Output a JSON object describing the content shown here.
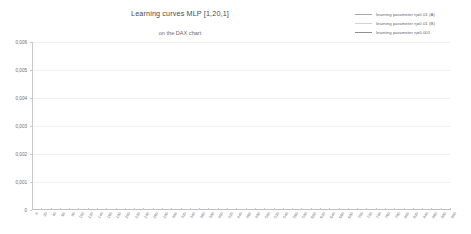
{
  "chart_data": {
    "type": "line",
    "title": "Learning curves MLP [1,20,1]",
    "subtitle": "on the DAX chart",
    "xlabel": "",
    "ylabel": "",
    "xlim": [
      0,
      900
    ],
    "ylim": [
      0,
      0.006
    ],
    "grid": true,
    "legend_position": "top-right",
    "y_ticks": [
      "0,006",
      "0,005",
      "0,004",
      "0,003",
      "0,002",
      "0,001",
      "0"
    ],
    "y_tick_values": [
      0.006,
      0.005,
      0.004,
      0.003,
      0.002,
      0.001,
      0
    ],
    "x_ticks": [
      "0",
      "20",
      "40",
      "60",
      "80",
      "100",
      "120",
      "140",
      "160",
      "180",
      "200",
      "220",
      "240",
      "260",
      "280",
      "300",
      "320",
      "340",
      "360",
      "380",
      "400",
      "420",
      "440",
      "460",
      "480",
      "500",
      "520",
      "540",
      "560",
      "580",
      "600",
      "620",
      "640",
      "660",
      "680",
      "700",
      "720",
      "740",
      "760",
      "780",
      "800",
      "820",
      "840",
      "860",
      "880",
      "900"
    ],
    "series": [
      {
        "name": "learning parameter η=0.01  (A)",
        "color": "#a8a8a8",
        "x": [
          0,
          3,
          6,
          10,
          16,
          24,
          36,
          52,
          75,
          110,
          160,
          230,
          320,
          430,
          560,
          700,
          820,
          900
        ],
        "values": [
          0.006,
          0.0046,
          0.00415,
          0.00398,
          0.0039,
          0.00386,
          0.00384,
          0.00383,
          0.00382,
          0.00381,
          0.0038,
          0.0038,
          0.00379,
          0.00379,
          0.00378,
          0.00378,
          0.00378,
          0.00378
        ]
      },
      {
        "name": "learning parameter η=0.01  (B)",
        "color": "#d2d2d2",
        "x": [
          0,
          3,
          6,
          10,
          16,
          24,
          36,
          48,
          58,
          60,
          62,
          64,
          70,
          80,
          95,
          110,
          130,
          160,
          200,
          260,
          340,
          440,
          560,
          700,
          820,
          900
        ],
        "values": [
          0.006,
          0.0045,
          0.004,
          0.00382,
          0.00375,
          0.00372,
          0.00371,
          0.00371,
          0.00371,
          0.00371,
          0.0026,
          0.00128,
          0.00122,
          0.00128,
          0.00134,
          0.00136,
          0.00136,
          0.00135,
          0.00134,
          0.00134,
          0.00133,
          0.00133,
          0.00132,
          0.00132,
          0.00132,
          0.00132
        ]
      },
      {
        "name": "learning parameter η=0.001",
        "color": "#8f8f8f",
        "x": [
          0,
          3,
          6,
          10,
          16,
          24,
          40,
          70,
          110,
          160,
          220,
          280,
          296,
          300,
          304,
          310,
          320,
          340,
          360,
          390,
          420,
          450,
          480,
          510,
          540,
          570,
          600,
          640,
          680,
          720,
          760,
          800,
          840,
          880,
          900
        ],
        "values": [
          0.006,
          0.0047,
          0.0042,
          0.004,
          0.00391,
          0.00387,
          0.00384,
          0.00382,
          0.00381,
          0.0038,
          0.00379,
          0.00379,
          0.00379,
          0.003,
          0.0018,
          0.0012,
          0.00112,
          0.00106,
          0.00103,
          0.00101,
          0.001,
          0.001,
          0.00101,
          0.00103,
          0.00106,
          0.0011,
          0.00114,
          0.00118,
          0.0012,
          0.00121,
          0.00121,
          0.00121,
          0.0012,
          0.0012,
          0.0012
        ]
      }
    ]
  }
}
